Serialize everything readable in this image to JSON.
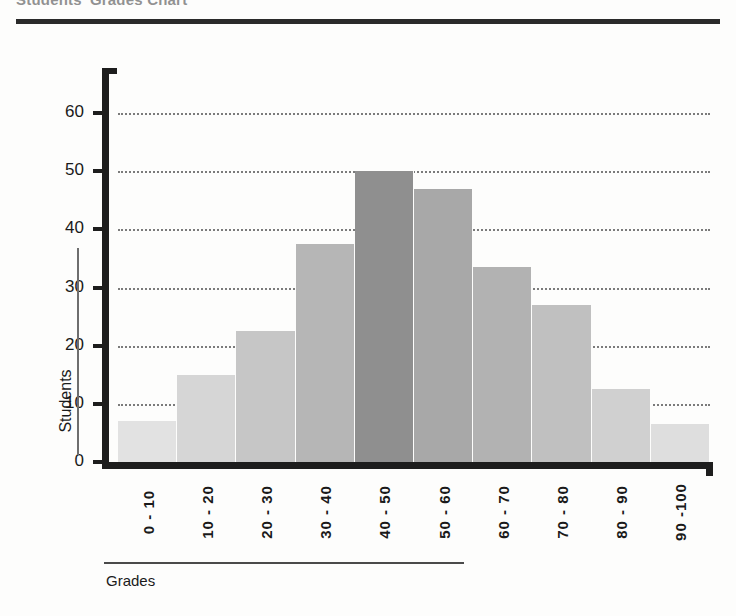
{
  "document": {
    "title": "Students' Grades Chart"
  },
  "chart_data": {
    "type": "bar",
    "title": "Students' Grades Chart",
    "xlabel": "Grades",
    "ylabel": "Students",
    "categories": [
      "0 - 10",
      "10 - 20",
      "20 - 30",
      "30 - 40",
      "40 - 50",
      "50 - 60",
      "60 - 70",
      "70 - 80",
      "80 - 90",
      "90 -100"
    ],
    "values": [
      7,
      15,
      22.5,
      37.5,
      50,
      47,
      33.5,
      27,
      12.5,
      6.5
    ],
    "bar_colors": [
      "#e2e2e2",
      "#d6d6d6",
      "#c6c6c6",
      "#b6b6b6",
      "#8f8f8f",
      "#a8a8a8",
      "#b2b2b2",
      "#c0c0c0",
      "#d0d0d0",
      "#dedede"
    ],
    "highlight_index": 4,
    "ylim": [
      0,
      65
    ],
    "yticks": [
      0,
      10,
      20,
      30,
      40,
      50,
      60
    ],
    "ytick_labels": [
      "0",
      "10",
      "20",
      "30",
      "40",
      "50",
      "60"
    ],
    "gridlines": [
      10,
      20,
      30,
      40,
      50,
      60
    ],
    "grid": true,
    "grid_style": "dotted",
    "legend": "none"
  }
}
